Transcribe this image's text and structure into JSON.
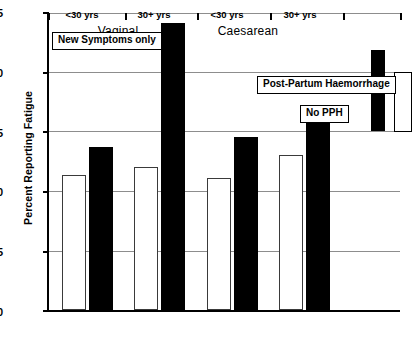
{
  "chart_data": {
    "type": "bar",
    "title": "",
    "xlabel": "",
    "ylabel": "Percent Reporting Fatigue",
    "ylim": [
      0,
      25
    ],
    "yticks": [
      0,
      5,
      10,
      15,
      20,
      25
    ],
    "grid": true,
    "legend_position": "inside-right",
    "categories": [
      "<30 yrs",
      "30+ yrs",
      "<30 yrs",
      "30+ yrs"
    ],
    "group_labels": [
      "Vaginal",
      "Caesarean"
    ],
    "series": [
      {
        "name": "No PPH",
        "style": "hollow",
        "values": [
          11.3,
          12.0,
          11.0,
          13.0
        ]
      },
      {
        "name": "Post-Partum Haemorrhage",
        "style": "solid",
        "values": [
          13.6,
          24.0,
          14.5,
          16.5
        ]
      }
    ],
    "annotations": [
      {
        "text": "New Symptoms only"
      },
      {
        "text": "Post-Partum Haemorrhage"
      },
      {
        "text": "No PPH"
      }
    ],
    "legend_entries": [
      {
        "label": "Post-Partum Haemorrhage",
        "style": "solid",
        "color": "#000000"
      },
      {
        "label": "No PPH",
        "style": "hollow",
        "color": "#ffffff"
      }
    ]
  },
  "yticks": {
    "t0": "0",
    "t5": "5",
    "t10": "10",
    "t15": "15",
    "t20": "20",
    "t25": "25"
  },
  "axis": {
    "ylabel": "Percent Reporting Fatigue"
  },
  "xaxis": {
    "ticks": [
      "<30 yrs",
      "30+ yrs",
      "<30 yrs",
      "30+ yrs"
    ],
    "groups": [
      "Vaginal",
      "Caesarean"
    ]
  },
  "annotations": {
    "new_symptoms": "New Symptoms only",
    "pph": "Post-Partum Haemorrhage",
    "no_pph": "No PPH"
  }
}
